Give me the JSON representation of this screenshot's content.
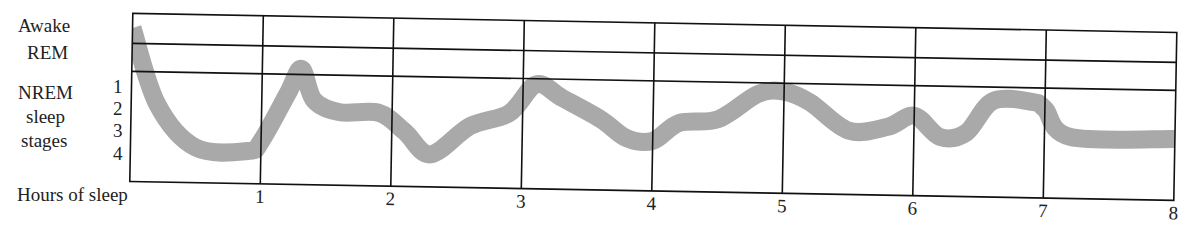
{
  "chart_data": {
    "type": "line",
    "title": "",
    "xlabel": "Hours of sleep",
    "ylabel": "",
    "x_ticks": [
      "1",
      "2",
      "3",
      "4",
      "5",
      "6",
      "7",
      "8"
    ],
    "xlim": [
      0,
      8
    ],
    "y_categories": [
      "Awake",
      "REM",
      "NREM 1",
      "NREM 2",
      "NREM 3",
      "NREM 4"
    ],
    "y_band_labels": {
      "awake": "Awake",
      "rem": "REM",
      "nrem_line1": "NREM",
      "nrem_line2": "sleep",
      "nrem_line3": "stages",
      "stage1": "1",
      "stage2": "2",
      "stage3": "3",
      "stage4": "4"
    },
    "grid": true,
    "line_color": "#a9a9a9",
    "series": [
      {
        "name": "Sleep stage",
        "note": "stage depth: 0=Awake, 1=REM, 2..5 = NREM 1..4",
        "x": [
          0.0,
          0.2,
          0.5,
          0.9,
          1.0,
          1.2,
          1.3,
          1.4,
          1.6,
          1.9,
          2.1,
          2.3,
          2.6,
          2.9,
          3.1,
          3.3,
          3.6,
          3.8,
          4.0,
          4.2,
          4.5,
          4.8,
          5.0,
          5.2,
          5.5,
          5.8,
          6.0,
          6.2,
          6.4,
          6.6,
          6.9,
          7.0,
          7.2,
          8.0
        ],
        "stage": [
          0.3,
          2.8,
          4.6,
          4.7,
          4.3,
          2.2,
          1.3,
          2.5,
          3.0,
          3.0,
          3.8,
          4.7,
          3.5,
          2.9,
          1.7,
          2.2,
          3.1,
          3.9,
          4.0,
          3.2,
          3.0,
          1.9,
          1.8,
          2.2,
          3.4,
          3.2,
          2.7,
          3.6,
          3.4,
          2.0,
          2.0,
          2.3,
          3.5,
          3.5
        ]
      }
    ]
  }
}
